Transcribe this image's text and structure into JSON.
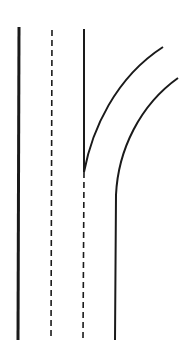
{
  "diagram": {
    "type": "road-lane-diagram",
    "stroke_color": "#1a1a1a",
    "background": "#ffffff",
    "elements": [
      {
        "name": "left-edge-line",
        "style": "solid",
        "x": 19,
        "y1": 27,
        "y2": 340
      },
      {
        "name": "lane-divider-dashed",
        "style": "dashed",
        "x": 52,
        "y1": 30,
        "y2": 340
      },
      {
        "name": "inner-edge-solid",
        "style": "solid",
        "x": 84,
        "y1": 29,
        "y2": 172
      },
      {
        "name": "inner-edge-dashed-continuation",
        "style": "dashed",
        "x": 84,
        "y1": 172,
        "y2": 340
      },
      {
        "name": "branch-inner-curve",
        "style": "solid",
        "from": [
          84,
          172
        ],
        "to": [
          163,
          47
        ]
      },
      {
        "name": "branch-outer-edge",
        "style": "solid",
        "from": [
          116,
          340
        ],
        "to": [
          178,
          78
        ]
      }
    ]
  }
}
